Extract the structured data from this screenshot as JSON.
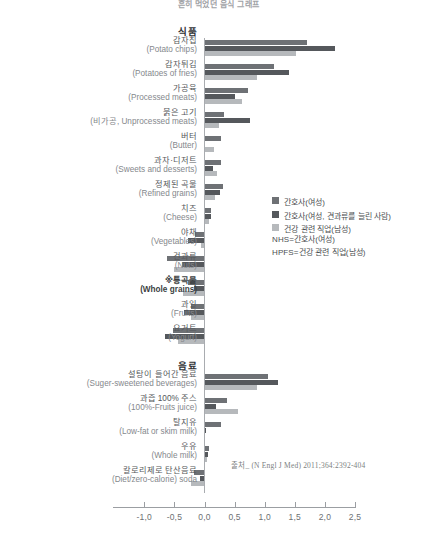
{
  "title": "흔히 먹었던 음식 그래프",
  "sections": {
    "foods": "식품",
    "beverages": "음료"
  },
  "legend": {
    "items": [
      {
        "label": "간호사(여성)",
        "color": "#6e7175"
      },
      {
        "label": "간호사(여성, 견과류를 늘린 사람)",
        "color": "#55585c"
      },
      {
        "label": "건강 관련 직업(남성)",
        "color": "#b6b9bc"
      }
    ],
    "notes": [
      "NHS=간호사(여성)",
      "HPFS=건강 관련 직업(남성)"
    ]
  },
  "source": "출처_ (N Engl J Med) 2011;364:2392-404",
  "axis": {
    "ticks": [
      "-1,0",
      "-0,5",
      "0,0",
      "0,5",
      "1,0",
      "1,5",
      "2,0",
      "2,5"
    ],
    "tick_values": [
      -1.0,
      -0.5,
      0.0,
      0.5,
      1.0,
      1.5,
      2.0,
      2.5
    ]
  },
  "chart_data": {
    "type": "bar",
    "orientation": "horizontal",
    "title": "흔히 먹었던 음식 그래프",
    "xlabel": "",
    "ylabel": "",
    "xlim": [
      -1.0,
      2.5
    ],
    "grid": false,
    "legend_position": "right-middle",
    "series": [
      {
        "name": "간호사(여성)",
        "color": "#6e7175"
      },
      {
        "name": "간호사(여성, 견과류를 늘린 사람)",
        "color": "#55585c"
      },
      {
        "name": "건강 관련 직업(남성)",
        "color": "#b6b9bc"
      }
    ],
    "groups": [
      {
        "group": "식품",
        "categories": [
          {
            "kr": "감자칩",
            "en": "(Potato chips)",
            "values": [
              1.7,
              2.17,
              1.52
            ],
            "bold": false
          },
          {
            "kr": "감자튀김",
            "en": "(Potatoes of fries)",
            "values": [
              1.15,
              1.4,
              0.88
            ],
            "bold": false
          },
          {
            "kr": "가공육",
            "en": "(Processed meats)",
            "values": [
              0.72,
              0.5,
              0.62
            ],
            "bold": false
          },
          {
            "kr": "붉은 고기",
            "en": "(비가공, Unprocessed meats)",
            "values": [
              0.33,
              0.75,
              0.24
            ],
            "bold": false
          },
          {
            "kr": "버터",
            "en": "(Butter)",
            "values": [
              0.28,
              0.0,
              0.16
            ],
            "bold": false
          },
          {
            "kr": "과자·디저트",
            "en": "(Sweets and desserts)",
            "values": [
              0.28,
              0.14,
              0.2
            ],
            "bold": false
          },
          {
            "kr": "정제된 곡물",
            "en": "(Refined grains)",
            "values": [
              0.3,
              0.26,
              0.18
            ],
            "bold": false
          },
          {
            "kr": "치즈",
            "en": "(Cheese)",
            "values": [
              0.11,
              0.1,
              0.08
            ],
            "bold": false
          },
          {
            "kr": "야채",
            "en": "(Vegetables)",
            "values": [
              -0.15,
              -0.28,
              -0.06
            ],
            "bold": false
          },
          {
            "kr": "건과류",
            "en": "(Nuts)",
            "values": [
              -0.62,
              -0.38,
              -0.5
            ],
            "bold": false
          },
          {
            "kr": "※통곡물",
            "en": "(Whole grains)",
            "values": [
              -0.27,
              -0.18,
              -0.35
            ],
            "bold": true
          },
          {
            "kr": "과일",
            "en": "(Fruits)",
            "values": [
              -0.23,
              -0.34,
              -0.22
            ],
            "bold": false
          },
          {
            "kr": "요거트",
            "en": "(Yogurt)",
            "values": [
              -0.53,
              -0.66,
              -0.44
            ],
            "bold": false
          }
        ]
      },
      {
        "group": "음료",
        "categories": [
          {
            "kr": "설탕이 들어간 음료",
            "en": "(Suger-sweetened beverages)",
            "values": [
              1.05,
              1.22,
              0.88
            ],
            "bold": false
          },
          {
            "kr": "과즙 100% 주스",
            "en": "(100%-Fruits juice)",
            "values": [
              0.38,
              0.19,
              0.56
            ],
            "bold": false
          },
          {
            "kr": "탈지유",
            "en": "(Low-fat or skim milk)",
            "values": [
              0.27,
              0.02,
              0.0
            ],
            "bold": false
          },
          {
            "kr": "우유",
            "en": "(Whole milk)",
            "values": [
              0.08,
              0.05,
              0.04
            ],
            "bold": false
          },
          {
            "kr": "칼로리제로 탄산음료",
            "en": "(Diet/zero-calorie) soda",
            "values": [
              -0.17,
              -0.07,
              -0.23
            ],
            "bold": false
          }
        ]
      }
    ]
  }
}
